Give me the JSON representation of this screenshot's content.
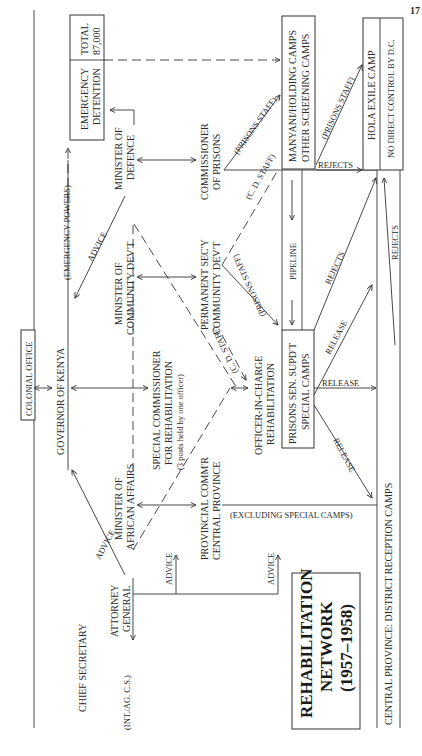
{
  "page_number": "17",
  "title": {
    "line1": "REHABILITATION",
    "line2": "NETWORK",
    "line3": "(1957–1958)"
  },
  "nodes": {
    "colonial_office": "COLONIAL OFFICE",
    "governor": "GOVERNOR OF KENYA",
    "chief_secretary": "CHIEF SECRETARY",
    "chief_secretary_note": "(INT./AG. C.S.)",
    "attorney_general": [
      "ATTORNEY",
      "GENERAL"
    ],
    "minister_african_affairs": [
      "MINISTER OF",
      "AFRICAN AFFAIRS"
    ],
    "minister_community_dev": [
      "MINISTER OF",
      "COMMUNITY DEV'T"
    ],
    "minister_defence": [
      "MINISTER OF",
      "DEFENCE"
    ],
    "special_commissioner": [
      "SPECIAL COMMISSIONER",
      "FOR REHABILITATION",
      "(3 posts held by one officer)"
    ],
    "provincial_commr": [
      "PROVINCIAL COMM'R",
      "CENTRAL PROVINCE"
    ],
    "permanent_secy": [
      "PERMANENT SEC'Y",
      "COMMUNITY DEV'T"
    ],
    "commissioner_prisons": [
      "COMMISSIONER",
      "OF PRISONS"
    ],
    "officer_in_charge": [
      "OFFICER-IN-CHARGE",
      "REHABILITATION"
    ],
    "prisons_sen_supdt": [
      "PRISONS SEN. SUPD'T",
      "SPECIAL CAMPS"
    ],
    "emergency_detention": [
      "EMERGENCY",
      "DETENTION"
    ],
    "total": [
      "TOTAL",
      "87,000"
    ],
    "manyani": [
      "MANYANI/HOLDING CAMPS",
      "OTHER SCREENING CAMPS"
    ],
    "hola": "HOLA EXILE CAMP",
    "no_direct_control": "NO DIRECT CONTROL BY D.C.",
    "district_reception": "CENTRAL PROVINCE: DISTRICT RECEPTION CAMPS"
  },
  "edge_labels": {
    "advice": "ADVICE",
    "emergency_powers": "(EMERGENCY POWERS)",
    "prisons_staff": "(PRISONS STAFF)",
    "cd_staff": "(C. D. STAFF)",
    "pipeline": "PIPELINE",
    "rejects": "REJECTS",
    "release": "RELEASE",
    "excluding_special": "(EXCLUDING SPECIAL CAMPS)"
  }
}
